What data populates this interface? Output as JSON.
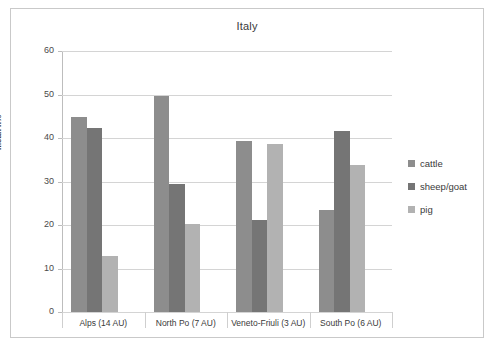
{
  "chart_data": {
    "type": "bar",
    "title": "Italy",
    "xlabel": "",
    "ylabel": "mean n%",
    "ylim": [
      0,
      60
    ],
    "yticks": [
      0,
      10,
      20,
      30,
      40,
      50,
      60
    ],
    "grid": true,
    "legend_position": "right",
    "categories": [
      "Alps (14 AU)",
      "North Po (7 AU)",
      "Veneto-Friuli (3 AU)",
      "South Po (6 AU)"
    ],
    "series": [
      {
        "name": "cattle",
        "color": "#8d8d8d",
        "values": [
          44.8,
          49.7,
          39.3,
          23.4
        ]
      },
      {
        "name": "sheep/goat",
        "color": "#757575",
        "values": [
          42.2,
          29.4,
          21.2,
          41.6
        ]
      },
      {
        "name": "pig",
        "color": "#b2b2b2",
        "values": [
          12.9,
          20.3,
          38.6,
          33.8
        ]
      }
    ]
  },
  "legend": {
    "items": [
      {
        "label": "cattle"
      },
      {
        "label": "sheep/goat"
      },
      {
        "label": "pig"
      }
    ]
  },
  "axis": {
    "y_tick_labels": [
      "60",
      "50",
      "40",
      "30",
      "20",
      "10",
      "0"
    ],
    "y_title": "mean n%"
  }
}
